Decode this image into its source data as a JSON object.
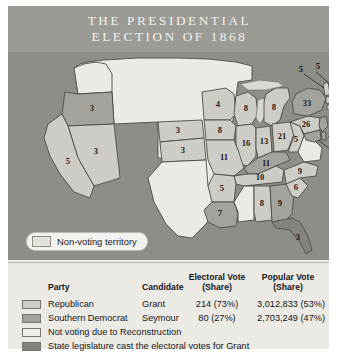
{
  "figure": {
    "title": "The Presidential\nElection of 1868"
  },
  "map": {
    "non_voting_pill": {
      "label": "Non-voting territory",
      "swatch_color": "#e4e2db"
    },
    "ocean_color": "#8e8e89",
    "states": [
      {
        "code": "OR",
        "name": "Oregon",
        "electoral_votes": "3",
        "party": "southern-democrat"
      },
      {
        "code": "NV",
        "name": "Nevada",
        "electoral_votes": "3",
        "party": "republican"
      },
      {
        "code": "CA",
        "name": "California",
        "electoral_votes": "5",
        "party": "republican"
      },
      {
        "code": "NE",
        "name": "Nebraska",
        "electoral_votes": "3",
        "party": "republican"
      },
      {
        "code": "KS",
        "name": "Kansas",
        "electoral_votes": "3",
        "party": "republican"
      },
      {
        "code": "MN",
        "name": "Minnesota",
        "electoral_votes": "4",
        "party": "republican"
      },
      {
        "code": "IA",
        "name": "Iowa",
        "electoral_votes": "8",
        "party": "republican"
      },
      {
        "code": "WI",
        "name": "Wisconsin",
        "electoral_votes": "8",
        "party": "republican"
      },
      {
        "code": "MI",
        "name": "Michigan",
        "electoral_votes": "8",
        "party": "republican"
      },
      {
        "code": "IL",
        "name": "Illinois",
        "electoral_votes": "16",
        "party": "republican"
      },
      {
        "code": "IN",
        "name": "Indiana",
        "electoral_votes": "13",
        "party": "republican"
      },
      {
        "code": "OH",
        "name": "Ohio",
        "electoral_votes": "21",
        "party": "republican"
      },
      {
        "code": "MO",
        "name": "Missouri",
        "electoral_votes": "11",
        "party": "republican"
      },
      {
        "code": "KY",
        "name": "Kentucky",
        "electoral_votes": "11",
        "party": "southern-democrat"
      },
      {
        "code": "WV",
        "name": "West Virginia",
        "electoral_votes": "5",
        "party": "republican"
      },
      {
        "code": "TN",
        "name": "Tennessee",
        "electoral_votes": "10",
        "party": "republican"
      },
      {
        "code": "AR",
        "name": "Arkansas",
        "electoral_votes": "5",
        "party": "republican"
      },
      {
        "code": "LA",
        "name": "Louisiana",
        "electoral_votes": "7",
        "party": "southern-democrat"
      },
      {
        "code": "AL",
        "name": "Alabama",
        "electoral_votes": "8",
        "party": "republican"
      },
      {
        "code": "GA",
        "name": "Georgia",
        "electoral_votes": "9",
        "party": "southern-democrat"
      },
      {
        "code": "FL",
        "name": "Florida",
        "electoral_votes": "3",
        "party": "legislature"
      },
      {
        "code": "SC",
        "name": "South Carolina",
        "electoral_votes": "6",
        "party": "republican"
      },
      {
        "code": "NC",
        "name": "North Carolina",
        "electoral_votes": "9",
        "party": "republican"
      },
      {
        "code": "PA",
        "name": "Pennsylvania",
        "electoral_votes": "26",
        "party": "republican"
      },
      {
        "code": "NY",
        "name": "New York",
        "electoral_votes": "33",
        "party": "southern-democrat"
      },
      {
        "code": "VT",
        "name": "Vermont",
        "electoral_votes": "5",
        "party": "republican"
      },
      {
        "code": "NH",
        "name": "New Hampshire",
        "electoral_votes": "5",
        "party": "republican"
      },
      {
        "code": "ME",
        "name": "Maine",
        "electoral_votes": "7",
        "party": "republican"
      },
      {
        "code": "MA",
        "name": "Massachusetts",
        "electoral_votes": "12",
        "party": "republican"
      },
      {
        "code": "RI",
        "name": "Rhode Island",
        "electoral_votes": "4",
        "party": "republican"
      },
      {
        "code": "CT",
        "name": "Connecticut",
        "electoral_votes": "6",
        "party": "republican"
      },
      {
        "code": "NJ",
        "name": "New Jersey",
        "electoral_votes": "7",
        "party": "southern-democrat"
      },
      {
        "code": "DE",
        "name": "Delaware",
        "electoral_votes": "3",
        "party": "southern-democrat"
      },
      {
        "code": "MD",
        "name": "Maryland",
        "electoral_votes": "7",
        "party": "southern-democrat"
      },
      {
        "code": "VA",
        "name": "Virginia",
        "electoral_votes": "",
        "party": "not-voting"
      },
      {
        "code": "MS",
        "name": "Mississippi",
        "electoral_votes": "",
        "party": "not-voting"
      },
      {
        "code": "TX",
        "name": "Texas",
        "electoral_votes": "",
        "party": "not-voting"
      }
    ]
  },
  "legend": {
    "headers": {
      "party": "Party",
      "candidate": "Candidate",
      "electoral_vote": "Electoral Vote\n(Share)",
      "popular_vote": "Popular Vote\n(Share)"
    },
    "rows": [
      {
        "party": "Republican",
        "candidate": "Grant",
        "electoral_vote": "214 (73%)",
        "popular_vote": "3,012,833 (53%)",
        "swatch_color": "#cdccc6"
      },
      {
        "party": "Southern Democrat",
        "candidate": "Seymour",
        "electoral_vote": "80 (27%)",
        "popular_vote": "2,703,249 (47%)",
        "swatch_color": "#a3a29c"
      }
    ],
    "notes": [
      {
        "label": "Not voting due to Reconstruction",
        "swatch_color": "#eeece6"
      },
      {
        "label": "State legislature cast the electoral votes for Grant",
        "swatch_color": "#84837e"
      }
    ]
  }
}
